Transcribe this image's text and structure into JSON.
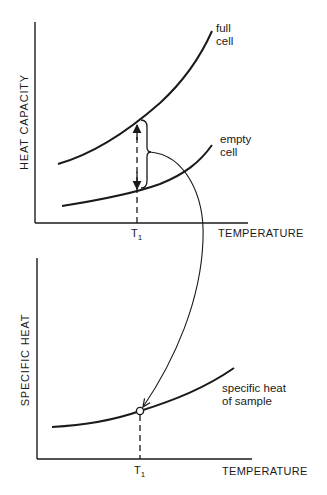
{
  "top_plot": {
    "y_label": "HEAT CAPACITY",
    "x_label": "TEMPERATURE",
    "t_label": "T",
    "t_sub": "1",
    "curves": [
      {
        "name": "full-cell",
        "label_line1": "full",
        "label_line2": "cell"
      },
      {
        "name": "empty-cell",
        "label_line1": "empty",
        "label_line2": "cell"
      }
    ]
  },
  "bottom_plot": {
    "y_label": "SPECIFIC HEAT",
    "x_label": "TEMPERATURE",
    "t_label": "T",
    "t_sub": "1",
    "curve": {
      "name": "specific-heat-of-sample",
      "label_line1": "specific heat",
      "label_line2": "of sample"
    }
  },
  "colors": {
    "ink": "#1a1a1a",
    "background": "#ffffff"
  }
}
